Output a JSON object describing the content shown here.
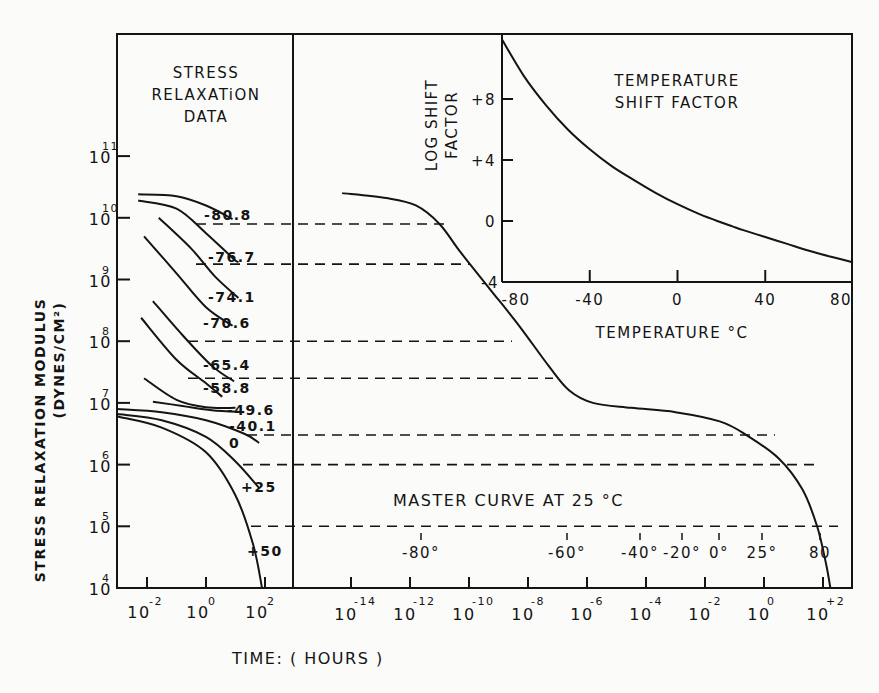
{
  "chart_data": [
    {
      "id": "stress_relaxation_data",
      "type": "line",
      "title": "STRESS RELAXATION DATA",
      "title_lines": [
        "STRESS",
        "RELAXATiON",
        "DATA"
      ],
      "xlabel": "TIME: ( HOURS )",
      "ylabel": "STRESS RELAXATION MODULUS",
      "ylabel_units": "(DYNES/CM²)",
      "yscale": "log",
      "xscale": "log",
      "ylim": [
        10000,
        100000000000.0
      ],
      "y_ticks": [
        {
          "exp": "11",
          "value": 100000000000.0
        },
        {
          "exp": "10",
          "value": 10000000000.0
        },
        {
          "exp": "9",
          "value": 1000000000.0
        },
        {
          "exp": "8",
          "value": 100000000.0
        },
        {
          "exp": "7",
          "value": 10000000.0
        },
        {
          "exp": "6",
          "value": 1000000.0
        },
        {
          "exp": "5",
          "value": 100000.0
        },
        {
          "exp": "4",
          "value": 10000.0
        }
      ],
      "x_ticks": [
        {
          "exp": "-2",
          "log": -2
        },
        {
          "exp": "0",
          "log": 0
        },
        {
          "exp": "2",
          "log": 2
        }
      ],
      "series": [
        {
          "name": "-80.8",
          "label": "-80.8",
          "points_log": [
            [
              -2.3,
              10.38
            ],
            [
              -1.0,
              10.35
            ],
            [
              0.0,
              10.2
            ],
            [
              0.9,
              9.98
            ]
          ]
        },
        {
          "name": "-76.7",
          "label": "-76.7",
          "points_log": [
            [
              -2.3,
              10.28
            ],
            [
              -1.0,
              10.15
            ],
            [
              0.0,
              9.75
            ],
            [
              0.9,
              9.35
            ],
            [
              1.1,
              9.28
            ]
          ]
        },
        {
          "name": "-74.1",
          "label": "-74.1",
          "points_log": [
            [
              -1.6,
              10.0
            ],
            [
              -0.5,
              9.5
            ],
            [
              0.3,
              9.05
            ],
            [
              1.1,
              8.7
            ]
          ]
        },
        {
          "name": "-70.6",
          "label": "-70.6",
          "points_log": [
            [
              -2.1,
              9.7
            ],
            [
              -1.0,
              9.1
            ],
            [
              0.0,
              8.55
            ],
            [
              0.9,
              8.25
            ]
          ]
        },
        {
          "name": "-65.4",
          "label": "-65.4",
          "points_log": [
            [
              -1.8,
              8.65
            ],
            [
              -0.8,
              8.1
            ],
            [
              0.2,
              7.6
            ],
            [
              0.95,
              7.35
            ]
          ]
        },
        {
          "name": "-58.8",
          "label": "-58.8",
          "points_log": [
            [
              -2.2,
              8.38
            ],
            [
              -1.0,
              7.7
            ],
            [
              0.0,
              7.32
            ],
            [
              0.55,
              7.1
            ]
          ]
        },
        {
          "name": "-49.6",
          "label": "-49.6",
          "points_log": [
            [
              -2.1,
              7.4
            ],
            [
              -1.0,
              7.05
            ],
            [
              0.0,
              6.93
            ],
            [
              1.0,
              6.92
            ]
          ]
        },
        {
          "name": "-40.1",
          "label": "-40.1",
          "points_log": [
            [
              -1.8,
              7.02
            ],
            [
              -0.8,
              6.95
            ],
            [
              0.2,
              6.88
            ],
            [
              1.3,
              6.85
            ]
          ]
        },
        {
          "name": "0",
          "label": "0",
          "points_log": [
            [
              -3.0,
              6.9
            ],
            [
              -1.5,
              6.85
            ],
            [
              0.0,
              6.72
            ],
            [
              1.3,
              6.5
            ],
            [
              1.8,
              6.35
            ]
          ]
        },
        {
          "name": "+25",
          "label": "+25",
          "points_log": [
            [
              -3.0,
              6.82
            ],
            [
              -1.5,
              6.72
            ],
            [
              0.0,
              6.45
            ],
            [
              1.0,
              6.05
            ],
            [
              1.8,
              5.62
            ]
          ]
        },
        {
          "name": "+50",
          "label": "+50",
          "points_log": [
            [
              -3.0,
              6.78
            ],
            [
              -1.5,
              6.6
            ],
            [
              0.0,
              6.2
            ],
            [
              1.0,
              5.5
            ],
            [
              1.6,
              4.7
            ],
            [
              1.9,
              4.0
            ]
          ]
        }
      ]
    },
    {
      "id": "master_curve",
      "type": "line",
      "title": "MASTER CURVE AT 25 °C",
      "xscale": "log",
      "yscale": "log",
      "x_ticks": [
        {
          "exp": "-14",
          "log": -14
        },
        {
          "exp": "-12",
          "log": -12
        },
        {
          "exp": "-10",
          "log": -10
        },
        {
          "exp": "-8",
          "log": -8
        },
        {
          "exp": "-6",
          "log": -6
        },
        {
          "exp": "-4",
          "log": -4
        },
        {
          "exp": "-2",
          "log": -2
        },
        {
          "exp": "0",
          "log": 0
        },
        {
          "exp": "+2",
          "log": 2
        }
      ],
      "points_log": [
        [
          -14.3,
          10.4
        ],
        [
          -12.8,
          10.32
        ],
        [
          -11.8,
          10.2
        ],
        [
          -11.0,
          9.9
        ],
        [
          -10.3,
          9.45
        ],
        [
          -9.3,
          8.85
        ],
        [
          -8.3,
          8.25
        ],
        [
          -7.3,
          7.6
        ],
        [
          -6.6,
          7.2
        ],
        [
          -5.8,
          7.0
        ],
        [
          -4.5,
          6.92
        ],
        [
          -3.0,
          6.85
        ],
        [
          -1.5,
          6.7
        ],
        [
          -0.6,
          6.48
        ],
        [
          0.5,
          6.1
        ],
        [
          1.3,
          5.6
        ],
        [
          1.8,
          5.0
        ],
        [
          2.1,
          4.4
        ],
        [
          2.25,
          4.0
        ]
      ],
      "dashed_levels_log": [
        9.9,
        9.25,
        8.0,
        7.4,
        6.48,
        6.0,
        5.0
      ],
      "temperature_markers": [
        {
          "label": "-80°",
          "log": -12.8
        },
        {
          "label": "-60°",
          "log": -6.7
        },
        {
          "label": "-40°",
          "log": -3.0
        },
        {
          "label": "-20°",
          "log": -1.5
        },
        {
          "label": "0°",
          "log": -0.6
        },
        {
          "label": "25°",
          "log": 0.0
        },
        {
          "label": "80",
          "log": 1.6
        }
      ]
    },
    {
      "id": "temperature_shift_factor",
      "type": "line",
      "title": "TEMPERATURE SHIFT FACTOR",
      "title_lines": [
        "TEMPERATURE",
        "SHIFT  FACTOR"
      ],
      "xlabel": "TEMPERATURE °C",
      "ylabel": "LOG SHIFT FACTOR",
      "ylabel_lines": [
        "LOG  SHIFT",
        "FACTOR"
      ],
      "xlim": [
        -80,
        80
      ],
      "ylim": [
        -4,
        12
      ],
      "x_ticks": [
        "-80",
        "-40",
        "0",
        "40",
        "80"
      ],
      "y_ticks": [
        "+8",
        "+4",
        "0",
        "-4"
      ],
      "x": [
        -80,
        -70,
        -60,
        -50,
        -40,
        -30,
        -20,
        -10,
        0,
        10,
        20,
        25,
        30,
        40,
        50,
        60,
        70,
        80
      ],
      "y": [
        11.9,
        9.5,
        7.6,
        6.0,
        4.7,
        3.6,
        2.7,
        1.85,
        1.1,
        0.45,
        -0.1,
        -0.35,
        -0.6,
        -1.05,
        -1.5,
        -1.95,
        -2.35,
        -2.7
      ]
    }
  ]
}
